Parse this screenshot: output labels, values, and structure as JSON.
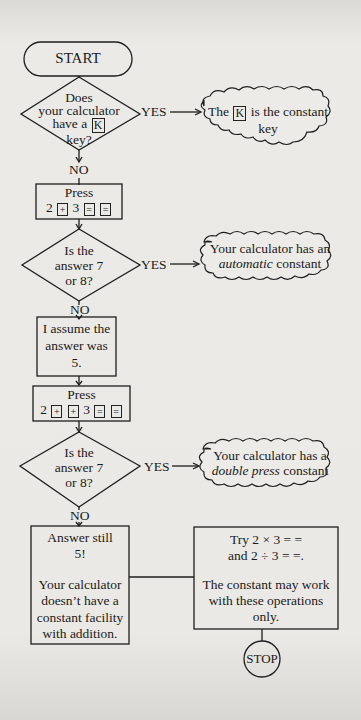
{
  "flowchart": {
    "start": "START",
    "stop": "STOP",
    "decision1": {
      "lines": [
        "Does",
        "your calculator",
        "have a",
        "key?"
      ],
      "key": "K"
    },
    "decision1_yes": "YES",
    "decision1_no": "NO",
    "result1": {
      "pre": "The",
      "key": "K",
      "post": "is the constant",
      "line2": "key"
    },
    "step1": {
      "title": "Press",
      "seq": {
        "n1": "2",
        "op": "+",
        "n2": "3",
        "eq1": "=",
        "eq2": "="
      }
    },
    "decision2": {
      "lines": [
        "Is the",
        "answer 7",
        "or 8?"
      ]
    },
    "decision2_yes": "YES",
    "decision2_no": "NO",
    "result2": {
      "line1": "Your calculator has an",
      "italic": "automatic",
      "line2_post": "constant"
    },
    "step2": {
      "lines": [
        "I assume the",
        "answer was",
        "5."
      ]
    },
    "step3": {
      "title": "Press",
      "seq": {
        "n1": "2",
        "op1": "+",
        "op2": "+",
        "n2": "3",
        "eq1": "=",
        "eq2": "="
      }
    },
    "decision3": {
      "lines": [
        "Is the",
        "answer 7",
        "or 8?"
      ]
    },
    "decision3_yes": "YES",
    "decision3_no": "NO",
    "result3": {
      "line1": "Your calculator has a",
      "italic": "double press",
      "line2_post": "constant"
    },
    "final_no": {
      "lines": [
        "Answer still",
        "5!",
        "",
        "Your calculator",
        "doesn’t have a",
        "constant facility",
        "with addition."
      ]
    },
    "final_try": {
      "lines": [
        "Try 2 × 3 = =",
        "and 2 ÷ 3 = =.",
        "",
        "The constant may work",
        "with these operations",
        "only."
      ]
    }
  },
  "colors": {
    "paper": "#e9e7e4",
    "ink": "#1a1a1a"
  }
}
